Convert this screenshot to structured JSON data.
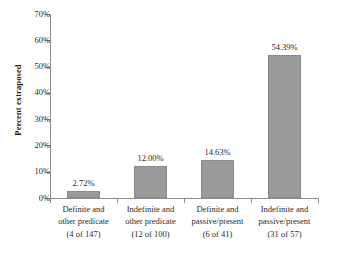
{
  "chart_data": {
    "type": "bar",
    "title": "",
    "subtitle": "",
    "xlabel": "",
    "ylabel": "Percent extraposed",
    "ylim": [
      0,
      70
    ],
    "grid": false,
    "legend": "none",
    "y_tick_labels": [
      "70%",
      "60%",
      "50%",
      "40%",
      "30%",
      "20%",
      "10%",
      "0%"
    ],
    "y_ticks": [
      70,
      60,
      50,
      40,
      30,
      20,
      10,
      0
    ],
    "categories": [
      "Definite and other predicate (4 of 147)",
      "Indefinite and other predicate (12 of 100)",
      "Definite and passive/present (6 of 41)",
      "Indefinite and passive/present (31 of 57)"
    ],
    "category_lines": [
      [
        "Definite and",
        "other predicate",
        "(4 of 147)"
      ],
      [
        "Indefinite and",
        "other predicate",
        "(12 of 100)"
      ],
      [
        "Definite and",
        "passive/present",
        "(6 of 41)"
      ],
      [
        "Indefinite and",
        "passive/present",
        "(31 of 57)"
      ]
    ],
    "values": [
      2.72,
      12.0,
      14.63,
      54.39
    ],
    "value_labels": [
      "2.72%",
      "12.00%",
      "14.63%",
      "54.39%"
    ],
    "numerators": [
      4,
      12,
      6,
      31
    ],
    "denominators": [
      147,
      100,
      41,
      57
    ],
    "bar_color": "#9a9a9a",
    "bar_border_color": "#8a8a8a",
    "axis_color": "#8d8d8d",
    "text_color": "#2b2b2b",
    "background": "#ffffff"
  }
}
